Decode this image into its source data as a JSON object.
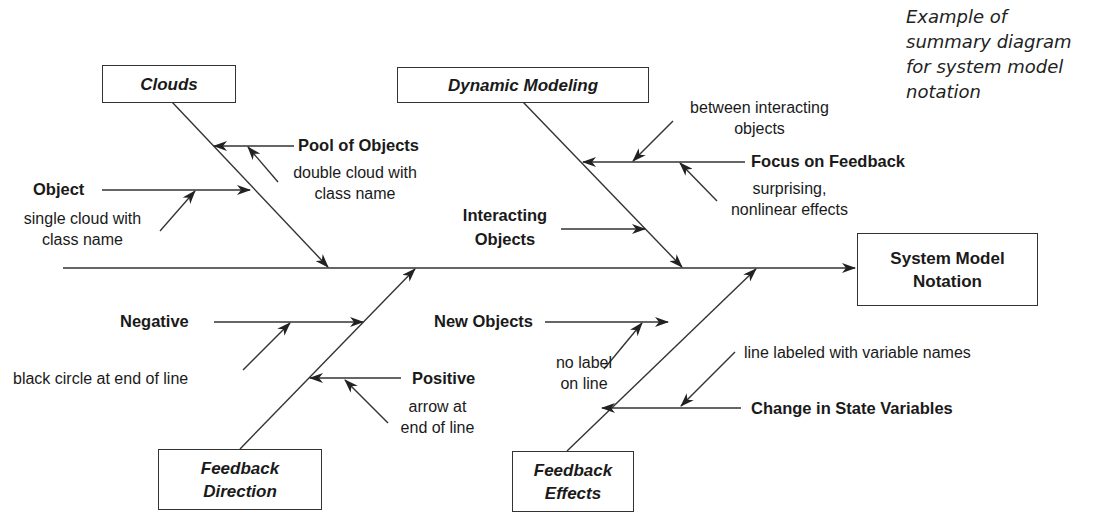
{
  "caption": {
    "lines": [
      "Example of",
      "summary diagram",
      "for system model",
      "notation"
    ]
  },
  "effect": {
    "label_line1": "System Model",
    "label_line2": "Notation"
  },
  "categories": {
    "clouds": {
      "title": "Clouds",
      "causes": {
        "pool_of_objects": {
          "label": "Pool of Objects",
          "note_line1": "double cloud with",
          "note_line2": "class name"
        },
        "object": {
          "label": "Object",
          "note_line1": "single cloud with",
          "note_line2": "class name"
        }
      }
    },
    "dynamic_modeling": {
      "title": "Dynamic Modeling",
      "causes": {
        "focus_on_feedback": {
          "label": "Focus on Feedback",
          "note_above_line1": "between interacting",
          "note_above_line2": "objects",
          "note_below_line1": "surprising,",
          "note_below_line2": "nonlinear effects"
        },
        "interacting_objects": {
          "label_line1": "Interacting",
          "label_line2": "Objects"
        }
      }
    },
    "feedback_direction": {
      "title_line1": "Feedback",
      "title_line2": "Direction",
      "causes": {
        "negative": {
          "label": "Negative",
          "note": "black circle at end of line"
        },
        "positive": {
          "label": "Positive",
          "note_line1": "arrow at",
          "note_line2": "end of line"
        }
      }
    },
    "feedback_effects": {
      "title_line1": "Feedback",
      "title_line2": "Effects",
      "causes": {
        "new_objects": {
          "label": "New Objects",
          "note_line1": "no label",
          "note_line2": "on line"
        },
        "change_in_state_variables": {
          "label": "Change in State Variables",
          "note": "line labeled with variable names"
        }
      }
    }
  },
  "colors": {
    "line": "#333333",
    "text": "#1a1a1a",
    "background": "#ffffff"
  }
}
